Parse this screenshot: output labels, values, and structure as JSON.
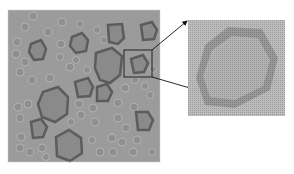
{
  "figure": {
    "main_image": {
      "description": "Grayscale micrograph of many polygonal particles, several large ones with dark rims",
      "background_color": "#9a9a9a",
      "particle_fill": "#8a8a8a",
      "particle_rim": "#5e5e5e",
      "bounds": {
        "x": 8,
        "y": 10,
        "width": 152,
        "height": 152
      }
    },
    "highlight_box": {
      "x": 124,
      "y": 50,
      "width": 28,
      "height": 27,
      "color": "#222222"
    },
    "inset_image": {
      "description": "Magnified view of boxed particle showing dotted texture and darker rim",
      "bounds": {
        "x": 188,
        "y": 20,
        "width": 97,
        "height": 96
      },
      "background_color": "#b8b8b8"
    },
    "arrows": [
      {
        "from": [
          152,
          50
        ],
        "to": [
          188,
          21
        ]
      },
      {
        "from": [
          152,
          77
        ],
        "to": [
          284,
          115
        ]
      }
    ]
  }
}
